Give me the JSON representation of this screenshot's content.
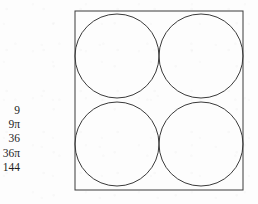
{
  "page": {
    "background_color": "#fdfdfd",
    "ink_color": "#2b2b2b"
  },
  "answer_choices": {
    "items": [
      {
        "label": "9"
      },
      {
        "label": "9π"
      },
      {
        "label": "36"
      },
      {
        "label": "36π"
      },
      {
        "label": "144"
      }
    ]
  },
  "figure": {
    "square": {
      "stroke_color": "#3a3a3a",
      "stroke_width": 1,
      "fill": "none",
      "x": 1,
      "y": 1,
      "width": 168,
      "height": 179
    },
    "circles": [
      {
        "name": "top-left-circle",
        "cx": 43,
        "cy": 46,
        "r": 42
      },
      {
        "name": "top-right-circle",
        "cx": 127,
        "cy": 46,
        "r": 42
      },
      {
        "name": "bottom-left-circle",
        "cx": 43,
        "cy": 134,
        "r": 42
      },
      {
        "name": "bottom-right-circle",
        "cx": 127,
        "cy": 134,
        "r": 42
      }
    ],
    "circle_stroke_color": "#3a3a3a",
    "circle_stroke_width": 1,
    "circle_fill": "none"
  }
}
